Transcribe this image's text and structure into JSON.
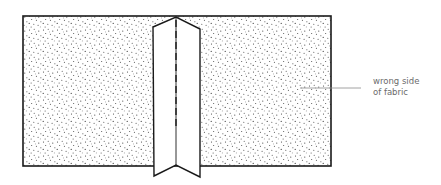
{
  "diagram": {
    "labels": [
      {
        "id": "wrong-side-label",
        "lines": [
          "wrong side",
          "of fabric"
        ]
      }
    ],
    "colors": {
      "outline": "#1a1a1a",
      "stipple": "#3a3a3a",
      "leader": "#8a8a8a",
      "label_text": "#6b6b6b",
      "background": "#ffffff"
    }
  }
}
